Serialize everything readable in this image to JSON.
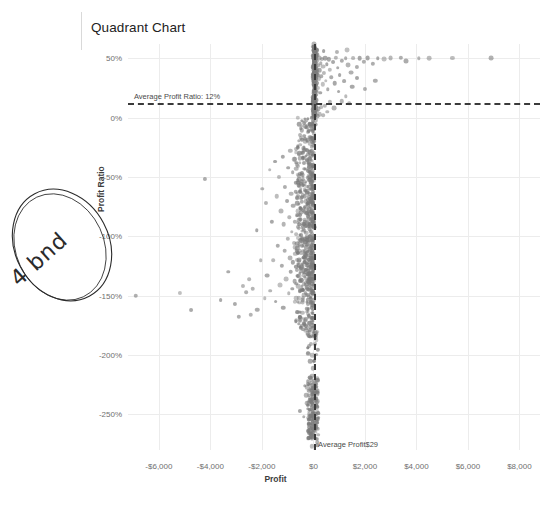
{
  "chart_data": {
    "type": "scatter",
    "title": "Quadrant Chart",
    "xlabel": "Profit",
    "ylabel": "Profit Ratio",
    "xlim": [
      -7200,
      8800
    ],
    "ylim": [
      -2.8,
      0.62
    ],
    "grid": true,
    "legend": "none",
    "xticks": [
      -6000,
      -4000,
      -2000,
      0,
      2000,
      4000,
      6000,
      8000
    ],
    "xtick_labels": [
      "-$6,000",
      "-$4,000",
      "-$2,000",
      "$0",
      "$2,000",
      "$4,000",
      "$6,000",
      "$8,000"
    ],
    "yticks": [
      0.5,
      0.0,
      -0.5,
      -1.0,
      -1.5,
      -2.0,
      -2.5
    ],
    "ytick_labels": [
      "50%",
      "0%",
      "-50%",
      "-100%",
      "-150%",
      "-200%",
      "-250%"
    ],
    "reference_lines": [
      {
        "orientation": "horizontal",
        "value": 0.12,
        "label": "Average Profit Ratio: 12%",
        "style": "dashed",
        "color": "#3a3a3a"
      },
      {
        "orientation": "vertical",
        "value": 29,
        "label": "Average Profit$29",
        "style": "dashed",
        "color": "#3a3a3a"
      }
    ],
    "marker": {
      "color": "#7b7b7b",
      "opacity": 0.62,
      "shape": "circle"
    },
    "points": [
      [
        -6900,
        -1.5
      ],
      [
        -5200,
        -1.48
      ],
      [
        -4750,
        -1.62
      ],
      [
        -4200,
        -0.52
      ],
      [
        -3600,
        -1.54
      ],
      [
        -3300,
        -1.3
      ],
      [
        -3050,
        -1.57
      ],
      [
        -2900,
        -1.68
      ],
      [
        -2750,
        -1.42
      ],
      [
        -2600,
        -1.47
      ],
      [
        -2500,
        -1.36
      ],
      [
        -2430,
        -1.66
      ],
      [
        -2350,
        -1.44
      ],
      [
        -2200,
        -0.95
      ],
      [
        -2180,
        -1.62
      ],
      [
        -2050,
        -1.2
      ],
      [
        -1980,
        -0.6
      ],
      [
        -1900,
        -1.52
      ],
      [
        -1850,
        -0.72
      ],
      [
        -1790,
        -1.33
      ],
      [
        -1700,
        -0.44
      ],
      [
        -1680,
        -1.46
      ],
      [
        -1600,
        -0.88
      ],
      [
        -1560,
        -1.2
      ],
      [
        -1500,
        -0.37
      ],
      [
        -1470,
        -1.55
      ],
      [
        -1420,
        -0.66
      ],
      [
        -1390,
        -1.08
      ],
      [
        -1330,
        -0.5
      ],
      [
        -1300,
        -1.41
      ],
      [
        -1270,
        -0.79
      ],
      [
        -1240,
        -1.25
      ],
      [
        -1200,
        -0.33
      ],
      [
        -1180,
        -1.6
      ],
      [
        -1150,
        -0.9
      ],
      [
        -1120,
        -1.12
      ],
      [
        -1090,
        -0.58
      ],
      [
        -1060,
        -1.36
      ],
      [
        -1030,
        -0.7
      ],
      [
        -1000,
        -1.02
      ],
      [
        -980,
        -0.42
      ],
      [
        -960,
        -1.48
      ],
      [
        -940,
        -0.84
      ],
      [
        -920,
        -1.18
      ],
      [
        -900,
        -0.28
      ],
      [
        -880,
        -1.3
      ],
      [
        -860,
        -0.64
      ],
      [
        -840,
        -0.96
      ],
      [
        -820,
        -1.44
      ],
      [
        -800,
        -0.46
      ],
      [
        -790,
        -1.22
      ],
      [
        -775,
        -0.74
      ],
      [
        -760,
        -1.06
      ],
      [
        -745,
        -0.35
      ],
      [
        -730,
        -1.38
      ],
      [
        -715,
        -0.88
      ],
      [
        -700,
        -1.15
      ],
      [
        -690,
        -0.55
      ],
      [
        -680,
        -1.52
      ],
      [
        -665,
        -0.98
      ],
      [
        -650,
        -0.4
      ],
      [
        -640,
        -1.28
      ],
      [
        -630,
        -0.68
      ],
      [
        -620,
        -1.1
      ],
      [
        -610,
        -0.82
      ],
      [
        -600,
        -0.25
      ],
      [
        -590,
        -1.42
      ],
      [
        -580,
        -0.93
      ],
      [
        -570,
        -1.2
      ],
      [
        -560,
        -0.52
      ],
      [
        -550,
        -1.33
      ],
      [
        -540,
        -0.76
      ],
      [
        -530,
        -1.04
      ],
      [
        -520,
        -0.38
      ],
      [
        -510,
        -1.46
      ],
      [
        -500,
        -0.86
      ],
      [
        -495,
        -1.14
      ],
      [
        -485,
        -0.6
      ],
      [
        -475,
        -1.26
      ],
      [
        -468,
        -0.99
      ],
      [
        -460,
        -0.3
      ],
      [
        -452,
        -1.37
      ],
      [
        -445,
        -0.71
      ],
      [
        -438,
        -1.08
      ],
      [
        -430,
        -0.48
      ],
      [
        -422,
        -1.54
      ],
      [
        -415,
        -0.91
      ],
      [
        -408,
        -1.18
      ],
      [
        -400,
        -0.34
      ],
      [
        -394,
        -1.3
      ],
      [
        -388,
        -0.78
      ],
      [
        -382,
        -1.02
      ],
      [
        -375,
        -0.56
      ],
      [
        -368,
        -1.4
      ],
      [
        -362,
        -0.95
      ],
      [
        -355,
        -1.22
      ],
      [
        -348,
        -0.43
      ],
      [
        -342,
        -1.12
      ],
      [
        -336,
        -0.66
      ],
      [
        -330,
        -1.34
      ],
      [
        -324,
        -0.88
      ],
      [
        -318,
        -1.05
      ],
      [
        -312,
        -0.27
      ],
      [
        -306,
        -1.48
      ],
      [
        -300,
        -0.8
      ],
      [
        -295,
        -1.16
      ],
      [
        -290,
        -0.54
      ],
      [
        -284,
        -1.28
      ],
      [
        -278,
        -0.97
      ],
      [
        -272,
        -1.09
      ],
      [
        -266,
        -0.36
      ],
      [
        -260,
        -1.43
      ],
      [
        -255,
        -0.73
      ],
      [
        -250,
        -1.01
      ],
      [
        -245,
        -0.62
      ],
      [
        -240,
        -1.24
      ],
      [
        -235,
        -0.89
      ],
      [
        -230,
        -1.32
      ],
      [
        -225,
        -0.45
      ],
      [
        -220,
        -1.13
      ],
      [
        -215,
        -0.69
      ],
      [
        -210,
        -1.38
      ],
      [
        -205,
        -0.92
      ],
      [
        -200,
        -1.06
      ],
      [
        -196,
        -0.31
      ],
      [
        -192,
        -1.2
      ],
      [
        -188,
        -0.77
      ],
      [
        -184,
        -1.45
      ],
      [
        -180,
        -0.58
      ],
      [
        -176,
        -1.03
      ],
      [
        -172,
        -0.85
      ],
      [
        -168,
        -1.27
      ],
      [
        -164,
        -0.4
      ],
      [
        -160,
        -1.16
      ],
      [
        -156,
        -0.72
      ],
      [
        -152,
        -1.35
      ],
      [
        -148,
        -0.94
      ],
      [
        -144,
        -1.08
      ],
      [
        -140,
        -0.5
      ],
      [
        -136,
        -1.22
      ],
      [
        -132,
        -0.81
      ],
      [
        -128,
        -1.41
      ],
      [
        -124,
        -0.64
      ],
      [
        -120,
        -1.0
      ],
      [
        -116,
        -0.9
      ],
      [
        -112,
        -1.3
      ],
      [
        -108,
        -0.46
      ],
      [
        -104,
        -1.18
      ],
      [
        -100,
        -0.75
      ],
      [
        -98,
        -1.52
      ],
      [
        -95,
        -0.86
      ],
      [
        -92,
        -1.1
      ],
      [
        -89,
        -0.56
      ],
      [
        -86,
        -1.26
      ],
      [
        -83,
        -0.96
      ],
      [
        -80,
        -1.36
      ],
      [
        -77,
        -0.42
      ],
      [
        -74,
        -1.14
      ],
      [
        -71,
        -0.68
      ],
      [
        -68,
        -1.44
      ],
      [
        -65,
        -0.88
      ],
      [
        -62,
        -1.04
      ],
      [
        -59,
        -0.6
      ],
      [
        -56,
        -1.24
      ],
      [
        -53,
        -0.98
      ],
      [
        -50,
        -1.33
      ],
      [
        -48,
        -0.52
      ],
      [
        -46,
        -1.12
      ],
      [
        -44,
        -0.79
      ],
      [
        -42,
        -1.4
      ],
      [
        -40,
        -0.91
      ],
      [
        -38,
        -1.07
      ],
      [
        -36,
        -0.64
      ],
      [
        -34,
        -1.21
      ],
      [
        -32,
        -0.84
      ],
      [
        -30,
        -1.3
      ],
      [
        -28,
        -0.47
      ],
      [
        -26,
        -1.16
      ],
      [
        -24,
        -0.73
      ],
      [
        -22,
        -1.38
      ],
      [
        -20,
        -0.93
      ],
      [
        -18,
        -1.02
      ],
      [
        -16,
        -0.58
      ],
      [
        -14,
        -1.25
      ],
      [
        -12,
        -0.87
      ],
      [
        -280,
        -2.34
      ],
      [
        -230,
        -2.42
      ],
      [
        -190,
        -2.5
      ],
      [
        -160,
        -2.58
      ],
      [
        -140,
        -2.46
      ],
      [
        -120,
        -2.62
      ],
      [
        -105,
        -2.38
      ],
      [
        -92,
        -2.54
      ],
      [
        -80,
        -2.68
      ],
      [
        -70,
        -2.44
      ],
      [
        -62,
        -2.3
      ],
      [
        -55,
        -2.6
      ],
      [
        -48,
        -2.5
      ],
      [
        -42,
        -2.4
      ],
      [
        -36,
        -2.56
      ],
      [
        -30,
        -2.66
      ],
      [
        -26,
        -2.35
      ],
      [
        -22,
        -2.48
      ],
      [
        -18,
        -2.58
      ],
      [
        -15,
        -2.28
      ],
      [
        -12,
        -2.43
      ],
      [
        -10,
        -2.62
      ],
      [
        -520,
        -2.47
      ],
      [
        -380,
        -2.52
      ],
      [
        -330,
        -2.26
      ],
      [
        -10,
        -0.18
      ],
      [
        -9,
        -0.66
      ],
      [
        -8,
        -1.1
      ],
      [
        -7,
        -0.4
      ],
      [
        -6,
        -0.88
      ],
      [
        -5,
        -1.34
      ],
      [
        -4,
        -0.24
      ],
      [
        -3,
        -0.72
      ],
      [
        -2,
        -1.0
      ],
      [
        -1,
        -0.5
      ],
      [
        5,
        0.04
      ],
      [
        8,
        0.1
      ],
      [
        10,
        0.16
      ],
      [
        12,
        0.22
      ],
      [
        14,
        0.28
      ],
      [
        16,
        0.34
      ],
      [
        18,
        0.4
      ],
      [
        20,
        0.45
      ],
      [
        22,
        0.48
      ],
      [
        24,
        0.5
      ],
      [
        26,
        0.3
      ],
      [
        28,
        0.2
      ],
      [
        30,
        0.12
      ],
      [
        33,
        0.06
      ],
      [
        36,
        0.38
      ],
      [
        40,
        0.44
      ],
      [
        44,
        0.25
      ],
      [
        48,
        0.33
      ],
      [
        52,
        0.47
      ],
      [
        56,
        0.18
      ],
      [
        60,
        0.41
      ],
      [
        66,
        0.27
      ],
      [
        72,
        0.49
      ],
      [
        78,
        0.35
      ],
      [
        84,
        0.15
      ],
      [
        90,
        0.43
      ],
      [
        96,
        0.31
      ],
      [
        104,
        0.5
      ],
      [
        112,
        0.22
      ],
      [
        120,
        0.39
      ],
      [
        130,
        0.46
      ],
      [
        140,
        0.29
      ],
      [
        150,
        0.48
      ],
      [
        165,
        0.36
      ],
      [
        180,
        0.25
      ],
      [
        195,
        0.44
      ],
      [
        210,
        0.33
      ],
      [
        230,
        0.5
      ],
      [
        250,
        0.4
      ],
      [
        270,
        0.21
      ],
      [
        290,
        0.46
      ],
      [
        310,
        0.35
      ],
      [
        335,
        0.49
      ],
      [
        360,
        0.28
      ],
      [
        390,
        0.43
      ],
      [
        420,
        0.38
      ],
      [
        450,
        0.5
      ],
      [
        480,
        0.31
      ],
      [
        520,
        0.45
      ],
      [
        560,
        0.24
      ],
      [
        600,
        0.49
      ],
      [
        650,
        0.4
      ],
      [
        700,
        0.34
      ],
      [
        760,
        0.47
      ],
      [
        820,
        0.29
      ],
      [
        880,
        0.5
      ],
      [
        950,
        0.42
      ],
      [
        1020,
        0.36
      ],
      [
        1100,
        0.48
      ],
      [
        1180,
        0.31
      ],
      [
        1260,
        0.5
      ],
      [
        1350,
        0.44
      ],
      [
        1450,
        0.38
      ],
      [
        1550,
        0.5
      ],
      [
        1680,
        0.43
      ],
      [
        1800,
        0.5
      ],
      [
        1950,
        0.47
      ],
      [
        2100,
        0.5
      ],
      [
        2300,
        0.45
      ],
      [
        2500,
        0.5
      ],
      [
        2750,
        0.49
      ],
      [
        3000,
        0.5
      ],
      [
        3400,
        0.5
      ],
      [
        3600,
        0.48
      ],
      [
        4100,
        0.5
      ],
      [
        4500,
        0.5
      ],
      [
        5400,
        0.5
      ],
      [
        6900,
        0.5
      ],
      [
        1500,
        0.26
      ],
      [
        1700,
        0.33
      ],
      [
        1250,
        0.18
      ],
      [
        1400,
        0.12
      ],
      [
        980,
        0.22
      ],
      [
        1100,
        0.14
      ],
      [
        2000,
        0.24
      ],
      [
        2400,
        0.31
      ],
      [
        800,
        0.08
      ],
      [
        640,
        0.13
      ],
      [
        540,
        0.05
      ],
      [
        460,
        0.1
      ],
      [
        380,
        0.02
      ],
      [
        300,
        0.09
      ],
      [
        240,
        0.03
      ],
      [
        190,
        0.07
      ],
      [
        150,
        0.01
      ],
      [
        120,
        0.06
      ],
      [
        95,
        -0.02
      ],
      [
        78,
        0.04
      ],
      [
        62,
        -0.06
      ],
      [
        50,
        0.02
      ],
      [
        40,
        -0.1
      ],
      [
        32,
        0.05
      ],
      [
        26,
        -0.14
      ],
      [
        20,
        0.03
      ],
      [
        16,
        -0.2
      ],
      [
        30,
        0.56
      ],
      [
        60,
        0.55
      ],
      [
        150,
        0.57
      ],
      [
        400,
        0.56
      ],
      [
        900,
        0.55
      ],
      [
        1300,
        0.57
      ],
      [
        30,
        0.62
      ],
      [
        25,
        0.59
      ]
    ]
  }
}
